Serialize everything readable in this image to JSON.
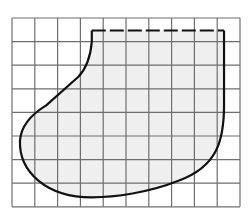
{
  "figure": {
    "grid": {
      "columns": 10,
      "rows": 8,
      "x0": 12,
      "y0": 18,
      "cell_w": 22.8,
      "cell_h": 23.6,
      "line_color": "#6e6e6e"
    },
    "region": {
      "fill_color": "#efefef",
      "stroke_color": "#111111",
      "top_edge_style": "dashed",
      "top_edge_grid": {
        "from_col": 3.5,
        "to_col": 9.3,
        "row": 0.5
      }
    }
  }
}
